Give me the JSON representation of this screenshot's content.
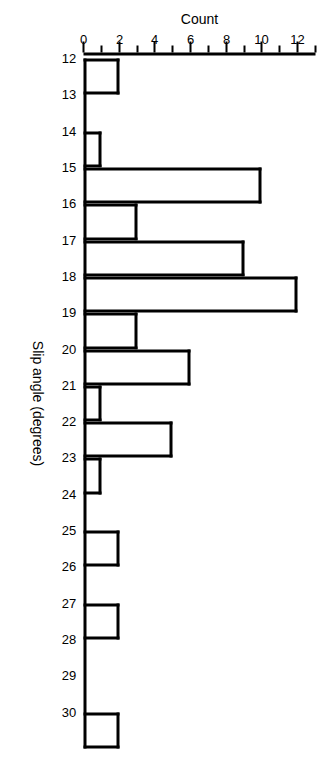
{
  "chart_data": {
    "type": "bar",
    "title": "",
    "subtitle": "",
    "xlabel": "Slip angle (degrees)",
    "ylabel": "Count",
    "orientation": "rotated-90-clockwise",
    "grid": false,
    "legend": null,
    "xlim": [
      12,
      30
    ],
    "ylim": [
      0,
      13
    ],
    "x_tick_labels": [
      "12",
      "13",
      "14",
      "15",
      "16",
      "17",
      "18",
      "19",
      "20",
      "21",
      "22",
      "23",
      "24",
      "25",
      "26",
      "27",
      "28",
      "29",
      "30"
    ],
    "y_tick_labels": [
      "0",
      "2",
      "4",
      "6",
      "8",
      "10",
      "12"
    ],
    "y_tick_values": [
      0,
      2,
      4,
      6,
      8,
      10,
      12
    ],
    "y_minor_tick_values": [
      1,
      3,
      5,
      7,
      9,
      11,
      13
    ],
    "bin_starts": [
      12,
      13,
      14,
      15,
      16,
      17,
      18,
      19,
      20,
      21,
      22,
      23,
      24,
      25,
      26,
      27,
      28,
      29,
      30
    ],
    "categories": [
      "12",
      "13",
      "14",
      "15",
      "16",
      "17",
      "18",
      "19",
      "20",
      "21",
      "22",
      "23",
      "24",
      "25",
      "26",
      "27",
      "28",
      "29",
      "30"
    ],
    "values": [
      2,
      0,
      1,
      10,
      3,
      9,
      12,
      3,
      6,
      1,
      5,
      1,
      0,
      2,
      0,
      2,
      0,
      0,
      2
    ],
    "bar_style": {
      "fill": "#ffffff",
      "edge": "#000000",
      "edge_width_px": 3
    }
  },
  "axis": {
    "count_title": "Count",
    "angle_title": "Slip angle (degrees)"
  }
}
